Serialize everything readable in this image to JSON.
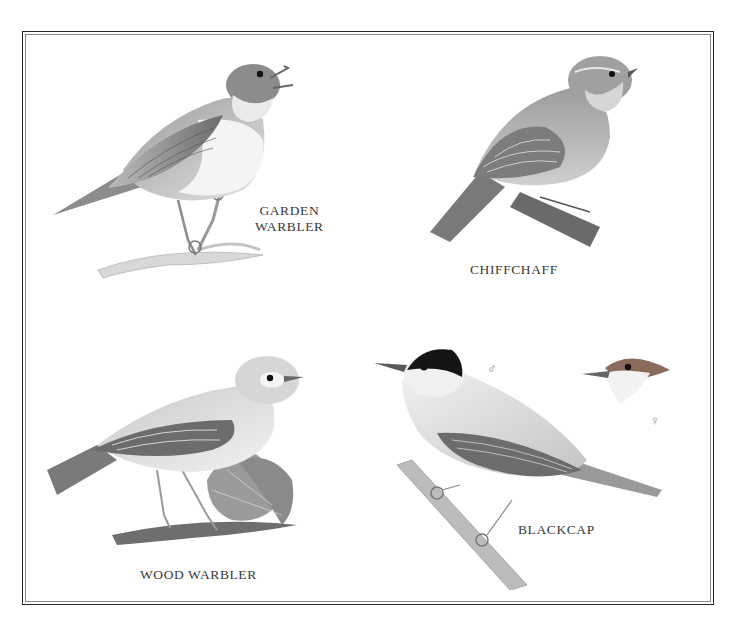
{
  "plate": {
    "page_number": "",
    "birds": [
      {
        "id": "garden-warbler",
        "label_lines": [
          "GARDEN",
          "WARBLER"
        ]
      },
      {
        "id": "chiffchaff",
        "label_lines": [
          "CHIFFCHAFF"
        ]
      },
      {
        "id": "wood-warbler",
        "label_lines": [
          "WOOD WARBLER"
        ]
      },
      {
        "id": "blackcap",
        "label_lines": [
          "BLACKCAP"
        ],
        "male_symbol": "♂",
        "female_symbol": "♀"
      }
    ]
  },
  "colors": {
    "frame_outer": "#2a2a2a",
    "frame_inner": "#8a8a8a",
    "label_text": "#3a3a3a",
    "blackcap_male_cap": "#141414",
    "blackcap_female_cap": "#8a6a5a"
  }
}
